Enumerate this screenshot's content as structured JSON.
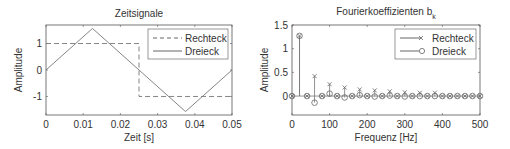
{
  "chart_data": [
    {
      "type": "line",
      "title": "Zeitsignale",
      "xlabel": "Zeit [s]",
      "ylabel": "Amplitude",
      "xlim": [
        0,
        0.05
      ],
      "ylim": [
        -1.7,
        1.7
      ],
      "xticks": [
        "0",
        "0.01",
        "0.02",
        "0.03",
        "0.04",
        "0.05"
      ],
      "yticks": [
        "-1",
        "0",
        "1"
      ],
      "legend_position": "upper right",
      "series": [
        {
          "name": "Rechteck",
          "style": "dashed",
          "x": [
            0,
            0.025,
            0.025,
            0.05
          ],
          "y": [
            1,
            1,
            -1,
            -1
          ]
        },
        {
          "name": "Dreieck",
          "style": "solid",
          "x": [
            0,
            0.0125,
            0.0375,
            0.05
          ],
          "y": [
            0,
            1.57,
            -1.57,
            0
          ]
        }
      ]
    },
    {
      "type": "stem",
      "title": "Fourierkoeffizienten b",
      "title_subscript": "k",
      "xlabel": "Frequenz [Hz]",
      "ylabel": "Amplitude",
      "xlim": [
        0,
        500
      ],
      "ylim": [
        -0.4,
        1.5
      ],
      "xticks": [
        "0",
        "100",
        "200",
        "300",
        "400",
        "500"
      ],
      "yticks": [
        "0",
        "0.5",
        "1",
        "1.5"
      ],
      "legend_position": "upper right",
      "x": [
        0,
        20,
        40,
        60,
        80,
        100,
        120,
        140,
        160,
        180,
        200,
        220,
        240,
        260,
        280,
        300,
        320,
        340,
        360,
        380,
        400,
        420,
        440,
        460,
        480,
        500
      ],
      "series": [
        {
          "name": "Rechteck",
          "marker": "x",
          "values": [
            0,
            1.27,
            0,
            0.42,
            0,
            0.25,
            0,
            0.18,
            0,
            0.14,
            0,
            0.12,
            0,
            0.1,
            0,
            0.08,
            0,
            0.07,
            0,
            0.07,
            0,
            0,
            0,
            0,
            0,
            0
          ]
        },
        {
          "name": "Dreieck",
          "marker": "o",
          "values": [
            0,
            1.27,
            0,
            -0.14,
            0,
            0.05,
            0,
            -0.03,
            0,
            0.02,
            0,
            -0.01,
            0,
            0.01,
            0,
            -0.01,
            0,
            0,
            0,
            0,
            0,
            0,
            0,
            0,
            0,
            0
          ]
        }
      ]
    }
  ]
}
